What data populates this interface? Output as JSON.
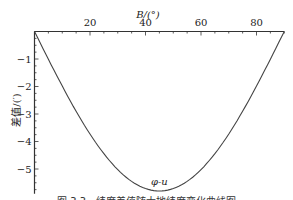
{
  "chart_data": {
    "type": "line",
    "title": "",
    "xlabel": "B/(°)",
    "ylabel": "差值/(′)",
    "xlim": [
      0,
      90
    ],
    "ylim": [
      -5.8,
      0
    ],
    "x_ticks": [
      20,
      40,
      60,
      80
    ],
    "y_ticks": [
      -1,
      -2,
      -3,
      -4,
      -5
    ],
    "x_axis_position": "top",
    "grid": false,
    "series": [
      {
        "name": "φ-u",
        "x": [
          0,
          10,
          20,
          30,
          40,
          45,
          50,
          60,
          70,
          80,
          90
        ],
        "values": [
          0,
          -2.0,
          -3.75,
          -5.0,
          -5.7,
          -5.8,
          -5.7,
          -5.0,
          -3.75,
          -2.0,
          0
        ]
      }
    ],
    "annotations": [
      {
        "text": "φ-u",
        "x": 45,
        "y": -5.5
      }
    ]
  },
  "caption": "图 3.3　纬度差值随大地纬度变化曲线图"
}
